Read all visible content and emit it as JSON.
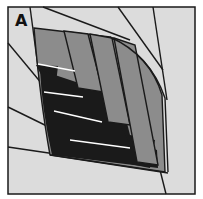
{
  "panel": {
    "label": "A",
    "description": "Pennate leaf-like structure with radiating lines and layered fiber bands"
  },
  "colors": {
    "background": "#ffffff",
    "panel_fill": "#dcdcdc",
    "mid_gray": "#8c8c8c",
    "dark": "#1a1a1a",
    "stroke": "#1a1a1a",
    "highlight": "#ffffff"
  }
}
